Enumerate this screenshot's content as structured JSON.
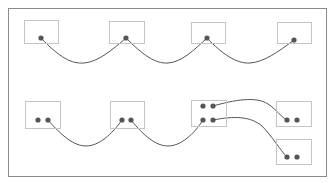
{
  "colors": {
    "background": "#ffffff",
    "frame_stroke": "#8a8a8a",
    "node_stroke": "#c4c4c4",
    "edge_stroke": "#555555",
    "port_fill": "#555555"
  },
  "frame": {
    "x": 8,
    "y": 8,
    "w": 318,
    "h": 168
  },
  "nodes": [
    {
      "id": "n1",
      "x": 24,
      "y": 20,
      "w": 34,
      "h": 23,
      "ports": [
        {
          "x": 41,
          "y": 38
        }
      ]
    },
    {
      "id": "n2",
      "x": 109,
      "y": 21,
      "w": 35,
      "h": 22,
      "ports": [
        {
          "x": 126,
          "y": 38
        }
      ]
    },
    {
      "id": "n3",
      "x": 191,
      "y": 22,
      "w": 34,
      "h": 21,
      "ports": [
        {
          "x": 207,
          "y": 38
        }
      ]
    },
    {
      "id": "n4",
      "x": 277,
      "y": 22,
      "w": 34,
      "h": 21,
      "ports": [
        {
          "x": 294,
          "y": 40
        }
      ]
    },
    {
      "id": "n5",
      "x": 25,
      "y": 101,
      "w": 35,
      "h": 27,
      "ports": [
        {
          "x": 38,
          "y": 120
        },
        {
          "x": 48,
          "y": 120
        }
      ]
    },
    {
      "id": "n6",
      "x": 110,
      "y": 101,
      "w": 34,
      "h": 27,
      "ports": [
        {
          "x": 122,
          "y": 120
        },
        {
          "x": 131,
          "y": 120
        }
      ]
    },
    {
      "id": "n7",
      "x": 191,
      "y": 100,
      "w": 35,
      "h": 26,
      "ports": [
        {
          "x": 203,
          "y": 106
        },
        {
          "x": 213,
          "y": 106
        },
        {
          "x": 203,
          "y": 120
        },
        {
          "x": 213,
          "y": 120
        }
      ]
    },
    {
      "id": "n8",
      "x": 276,
      "y": 101,
      "w": 35,
      "h": 25,
      "ports": [
        {
          "x": 287,
          "y": 120
        },
        {
          "x": 297,
          "y": 120
        }
      ]
    },
    {
      "id": "n9",
      "x": 276,
      "y": 139,
      "w": 35,
      "h": 25,
      "ports": [
        {
          "x": 287,
          "y": 157
        },
        {
          "x": 297,
          "y": 157
        }
      ]
    }
  ],
  "edges": [
    {
      "from": "n1",
      "to": "n2",
      "d": "M41 38 C 60 58, 72 64, 84 63 C 98 62, 112 50, 126 38"
    },
    {
      "from": "n2",
      "to": "n3",
      "d": "M126 38 C 142 54, 155 64, 168 63 C 182 62, 194 50, 207 38"
    },
    {
      "from": "n3",
      "to": "n4",
      "d": "M207 38 C 222 54, 237 64, 250 63 C 264 62, 278 52, 294 40"
    },
    {
      "from": "n5",
      "to": "n6",
      "d": "M48 120 C 62 136, 74 146, 86 146 C 99 146, 112 134, 122 120"
    },
    {
      "from": "n6",
      "to": "n7",
      "d": "M131 120 C 144 136, 156 146, 168 146 C 181 146, 194 134, 203 120"
    },
    {
      "from": "n7",
      "to": "n8",
      "d": "M213 106 C 234 100, 256 96, 268 104 C 277 110, 281 117, 287 120"
    },
    {
      "from": "n7",
      "to": "n9",
      "d": "M213 120 C 234 116, 250 116, 262 126 C 272 136, 280 150, 287 157"
    }
  ],
  "port_radius": 2.6
}
